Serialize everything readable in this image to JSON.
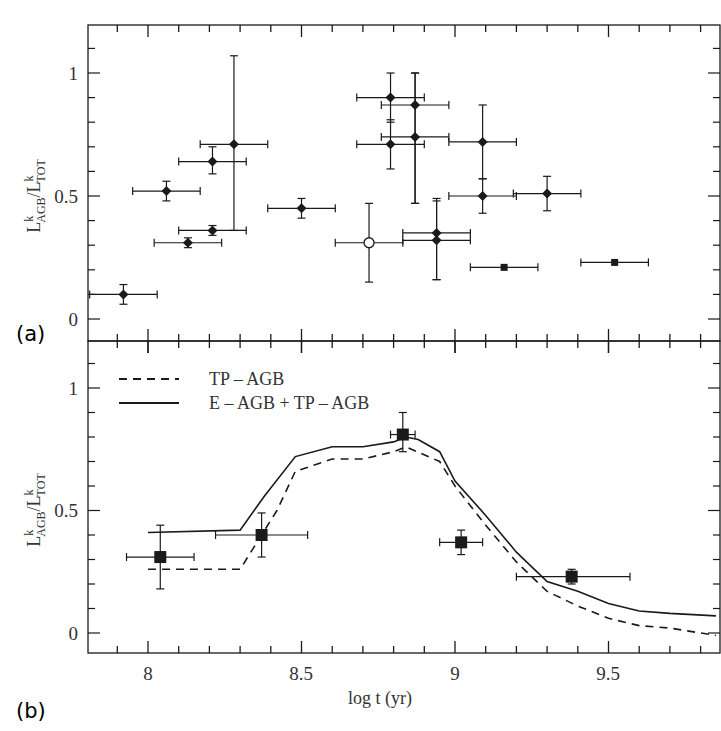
{
  "figure": {
    "panel_labels": [
      "(a)",
      "(b)"
    ],
    "xlabel": "log t (yr)",
    "ylabel_main": "L",
    "ylabel_sup": "k",
    "ylabel_sub_num": "AGB",
    "ylabel_sub_den": "TOT",
    "x_tick_labels": [
      "8",
      "8.5",
      "9",
      "9.5"
    ],
    "y_tick_labels": [
      "0",
      "0.5",
      "1"
    ]
  },
  "legend": {
    "items": [
      {
        "label": "TP – AGB",
        "style": "dashed"
      },
      {
        "label": "E – AGB + TP – AGB",
        "style": "solid"
      }
    ]
  },
  "colors": {
    "ink": "#1a1a1a",
    "background": "#ffffff"
  },
  "chart_data": [
    {
      "panel": "(a)",
      "type": "scatter",
      "title": "",
      "xlabel": "log t (yr)",
      "ylabel": "L^k_AGB / L^k_TOT",
      "xlim": [
        7.8,
        9.85
      ],
      "ylim": [
        -0.1,
        1.2
      ],
      "x_ticks": [
        8,
        8.5,
        9,
        9.5
      ],
      "y_ticks": [
        0,
        0.5,
        1
      ],
      "grid": false,
      "points": [
        {
          "x": 7.92,
          "y": 0.1,
          "xerr": 0.11,
          "yerr_lo": 0.04,
          "yerr_hi": 0.04,
          "marker": "filled-diamond"
        },
        {
          "x": 8.06,
          "y": 0.52,
          "xerr": 0.11,
          "yerr_lo": 0.04,
          "yerr_hi": 0.04,
          "marker": "filled-diamond"
        },
        {
          "x": 8.13,
          "y": 0.31,
          "xerr": 0.11,
          "yerr_lo": 0.02,
          "yerr_hi": 0.02,
          "marker": "filled-diamond"
        },
        {
          "x": 8.21,
          "y": 0.64,
          "xerr": 0.11,
          "yerr_lo": 0.05,
          "yerr_hi": 0.06,
          "marker": "filled-diamond"
        },
        {
          "x": 8.21,
          "y": 0.36,
          "xerr": 0.11,
          "yerr_lo": 0.02,
          "yerr_hi": 0.02,
          "marker": "filled-diamond"
        },
        {
          "x": 8.28,
          "y": 0.71,
          "xerr": 0.11,
          "yerr_lo": 0.35,
          "yerr_hi": 0.36,
          "marker": "filled-diamond"
        },
        {
          "x": 8.5,
          "y": 0.45,
          "xerr": 0.11,
          "yerr_lo": 0.04,
          "yerr_hi": 0.04,
          "marker": "filled-diamond"
        },
        {
          "x": 8.72,
          "y": 0.31,
          "xerr": 0.11,
          "yerr_lo": 0.16,
          "yerr_hi": 0.16,
          "marker": "open-circle"
        },
        {
          "x": 8.79,
          "y": 0.9,
          "xerr": 0.11,
          "yerr_lo": 0.1,
          "yerr_hi": 0.1,
          "marker": "filled-diamond"
        },
        {
          "x": 8.79,
          "y": 0.71,
          "xerr": 0.11,
          "yerr_lo": 0.1,
          "yerr_hi": 0.1,
          "marker": "filled-diamond"
        },
        {
          "x": 8.87,
          "y": 0.87,
          "xerr": 0.11,
          "yerr_lo": 0.4,
          "yerr_hi": 0.13,
          "marker": "filled-diamond"
        },
        {
          "x": 8.87,
          "y": 0.74,
          "xerr": 0.11,
          "yerr_lo": 0.27,
          "yerr_hi": 0.26,
          "marker": "filled-diamond"
        },
        {
          "x": 8.94,
          "y": 0.35,
          "xerr": 0.11,
          "yerr_lo": 0.19,
          "yerr_hi": 0.13,
          "marker": "filled-diamond"
        },
        {
          "x": 8.94,
          "y": 0.32,
          "xerr": 0.11,
          "yerr_lo": 0.16,
          "yerr_hi": 0.17,
          "marker": "filled-diamond"
        },
        {
          "x": 9.09,
          "y": 0.72,
          "xerr": 0.11,
          "yerr_lo": 0.15,
          "yerr_hi": 0.15,
          "marker": "filled-diamond"
        },
        {
          "x": 9.09,
          "y": 0.5,
          "xerr": 0.11,
          "yerr_lo": 0.07,
          "yerr_hi": 0.07,
          "marker": "filled-diamond"
        },
        {
          "x": 9.3,
          "y": 0.51,
          "xerr": 0.11,
          "yerr_lo": 0.07,
          "yerr_hi": 0.07,
          "marker": "filled-diamond"
        },
        {
          "x": 9.16,
          "y": 0.21,
          "xerr": 0.11,
          "yerr_lo": 0.0,
          "yerr_hi": 0.0,
          "marker": "filled-square"
        },
        {
          "x": 9.52,
          "y": 0.23,
          "xerr": 0.11,
          "yerr_lo": 0.0,
          "yerr_hi": 0.0,
          "marker": "filled-square"
        }
      ]
    },
    {
      "panel": "(b)",
      "type": "line",
      "title": "",
      "xlabel": "log t (yr)",
      "ylabel": "L^k_AGB / L^k_TOT",
      "xlim": [
        7.8,
        9.85
      ],
      "ylim": [
        -0.08,
        1.2
      ],
      "x_ticks": [
        8,
        8.5,
        9,
        9.5
      ],
      "y_ticks": [
        0,
        0.5,
        1
      ],
      "grid": false,
      "legend_position": "upper left",
      "series": [
        {
          "name": "TP – AGB",
          "style": "dashed",
          "x": [
            8.0,
            8.3,
            8.35,
            8.42,
            8.48,
            8.6,
            8.7,
            8.8,
            8.84,
            8.95,
            9.0,
            9.1,
            9.2,
            9.3,
            9.4,
            9.5,
            9.6,
            9.7,
            9.8,
            9.85
          ],
          "y": [
            0.26,
            0.26,
            0.36,
            0.5,
            0.66,
            0.71,
            0.71,
            0.74,
            0.76,
            0.7,
            0.6,
            0.44,
            0.29,
            0.17,
            0.11,
            0.06,
            0.03,
            0.02,
            0.0,
            -0.01
          ]
        },
        {
          "name": "E – AGB + TP – AGB",
          "style": "solid",
          "x": [
            8.0,
            8.3,
            8.38,
            8.48,
            8.6,
            8.7,
            8.8,
            8.84,
            8.88,
            8.95,
            9.0,
            9.1,
            9.2,
            9.3,
            9.4,
            9.5,
            9.6,
            9.7,
            9.85
          ],
          "y": [
            0.41,
            0.42,
            0.56,
            0.72,
            0.76,
            0.76,
            0.78,
            0.8,
            0.79,
            0.74,
            0.62,
            0.48,
            0.33,
            0.21,
            0.17,
            0.12,
            0.09,
            0.08,
            0.07
          ]
        }
      ],
      "points": [
        {
          "x": 8.04,
          "y": 0.31,
          "xerr_lo": 0.11,
          "xerr_hi": 0.11,
          "yerr_lo": 0.13,
          "yerr_hi": 0.13,
          "marker": "filled-square"
        },
        {
          "x": 8.37,
          "y": 0.4,
          "xerr_lo": 0.15,
          "xerr_hi": 0.15,
          "yerr_lo": 0.09,
          "yerr_hi": 0.09,
          "marker": "filled-square"
        },
        {
          "x": 8.83,
          "y": 0.81,
          "xerr_lo": 0.04,
          "xerr_hi": 0.04,
          "yerr_lo": 0.07,
          "yerr_hi": 0.09,
          "marker": "filled-square"
        },
        {
          "x": 9.02,
          "y": 0.37,
          "xerr_lo": 0.07,
          "xerr_hi": 0.07,
          "yerr_lo": 0.05,
          "yerr_hi": 0.05,
          "marker": "filled-square"
        },
        {
          "x": 9.38,
          "y": 0.23,
          "xerr_lo": 0.18,
          "xerr_hi": 0.19,
          "yerr_lo": 0.03,
          "yerr_hi": 0.03,
          "marker": "filled-square"
        }
      ]
    }
  ]
}
